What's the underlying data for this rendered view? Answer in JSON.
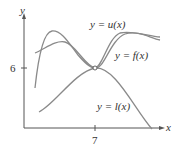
{
  "diagram": {
    "axes": {
      "x_label": "x",
      "y_label": "y",
      "x_tick_label": "7",
      "y_tick_label": "6"
    },
    "curves": [
      {
        "id": "u",
        "label": "y = u(x)"
      },
      {
        "id": "f",
        "label": "y = f(x)"
      },
      {
        "id": "l",
        "label": "y = l(x)"
      }
    ],
    "squeeze_point": {
      "x": 7,
      "y": 6
    },
    "colors": {
      "curve": "#8a8a8a",
      "axis": "#555555",
      "text": "#333333"
    }
  }
}
